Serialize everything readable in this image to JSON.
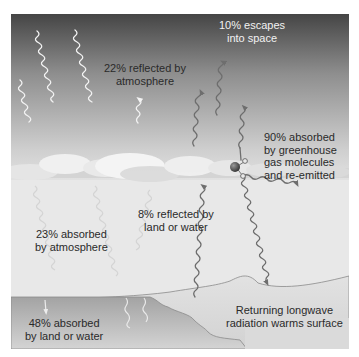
{
  "colors": {
    "sky_top": "#4a4a4a",
    "sky_mid": "#9a9a9a",
    "sky_low": "#d8d8d8",
    "lower_air": "#e9e9e9",
    "land": "#dcdcdc",
    "water_top": "#a9a9a9",
    "water_bottom": "#d0d0d0",
    "incoming_arrow": "#f0f0f0",
    "longwave_arrow": "#707070",
    "molecule_center": "#555555"
  },
  "labels": {
    "escapes": {
      "line1": "10% escapes",
      "line2": "into space"
    },
    "reflected_atmosphere": {
      "line1": "22% reflected by",
      "line2": "atmosphere"
    },
    "greenhouse": {
      "line1": "90% absorbed",
      "line2": "by greenhouse",
      "line3": "gas molecules",
      "line4": "and re-emitted"
    },
    "reflected_land": {
      "line1": "8% reflected by",
      "line2": "land or water"
    },
    "absorbed_atmosphere": {
      "line1": "23% absorbed",
      "line2": "by atmosphere"
    },
    "absorbed_land": {
      "line1": "48% absorbed",
      "line2": "by land or water"
    },
    "returning": {
      "line1": "Returning longwave",
      "line2": "radiation warms surface"
    }
  }
}
